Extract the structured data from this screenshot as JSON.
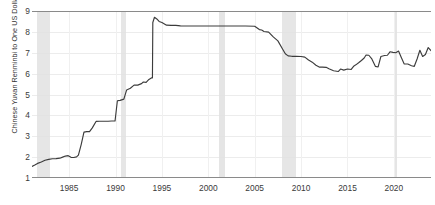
{
  "chart_data": {
    "type": "line",
    "title": "",
    "xlabel": "",
    "ylabel": "Chinese Yuvan Renminbi to One US Dollar",
    "xlim": [
      1981.0,
      2024.0
    ],
    "ylim": [
      1,
      9
    ],
    "yticks": [
      1,
      2,
      3,
      4,
      5,
      6,
      7,
      8,
      9
    ],
    "ytick_labels": [
      "1",
      "2",
      "3",
      "4",
      "5",
      "6",
      "7",
      "8",
      "9"
    ],
    "xticks": [
      1985,
      1990,
      1995,
      2000,
      2005,
      2010,
      2015,
      2020
    ],
    "xtick_labels": [
      "1985",
      "1990",
      "1995",
      "2000",
      "2005",
      "2010",
      "2015",
      "2020"
    ],
    "grid": "horizontal-and-vertical",
    "legend": "none",
    "line_color": "#3c3c3c",
    "recession_band_color": "#e2e2e2",
    "gridline_color": "#ececec",
    "axis_color": "#8a8a8a",
    "recession_bands": [
      {
        "start": 1981.5,
        "end": 1982.92,
        "label": "1981-1982 recession"
      },
      {
        "start": 1990.54,
        "end": 1991.17,
        "label": "1990-1991 recession"
      },
      {
        "start": 2001.17,
        "end": 2001.83,
        "label": "2001 recession"
      },
      {
        "start": 2007.96,
        "end": 2009.42,
        "label": "2008-2009 recession"
      },
      {
        "start": 2020.08,
        "end": 2020.33,
        "label": "2020 recession"
      }
    ],
    "series": [
      {
        "name": "Chinese Yuan Renminbi to One US Dollar",
        "x": [
          1981.0,
          1981.3,
          1981.6,
          1982.0,
          1982.4,
          1982.8,
          1983.2,
          1983.6,
          1984.0,
          1984.3,
          1984.6,
          1984.9,
          1985.2,
          1985.5,
          1985.8,
          1986.0,
          1986.3,
          1986.6,
          1986.9,
          1987.2,
          1987.5,
          1987.9,
          1988.3,
          1988.8,
          1989.2,
          1989.6,
          1989.95,
          1990.2,
          1990.5,
          1990.9,
          1991.2,
          1991.6,
          1992.0,
          1992.4,
          1992.8,
          1993.0,
          1993.3,
          1993.6,
          1993.9,
          1993.98,
          1994.02,
          1994.2,
          1994.45,
          1994.7,
          1995.0,
          1995.5,
          1996.0,
          1996.5,
          1997.0,
          1998.0,
          1999.0,
          2000.0,
          2001.0,
          2002.0,
          2003.0,
          2004.0,
          2005.0,
          2005.5,
          2005.75,
          2006.0,
          2006.5,
          2007.0,
          2007.5,
          2008.0,
          2008.3,
          2008.6,
          2009.0,
          2009.5,
          2010.0,
          2010.4,
          2010.8,
          2011.2,
          2011.6,
          2012.0,
          2012.3,
          2012.7,
          2013.0,
          2013.5,
          2014.0,
          2014.25,
          2014.6,
          2015.0,
          2015.4,
          2015.7,
          2015.9,
          2016.2,
          2016.5,
          2016.8,
          2017.0,
          2017.3,
          2017.6,
          2018.0,
          2018.3,
          2018.6,
          2019.0,
          2019.3,
          2019.6,
          2019.9,
          2020.2,
          2020.5,
          2020.8,
          2021.1,
          2021.5,
          2021.9,
          2022.2,
          2022.5,
          2022.8,
          2023.1,
          2023.4,
          2023.7,
          2024.0
        ],
        "y": [
          1.55,
          1.62,
          1.7,
          1.77,
          1.85,
          1.89,
          1.92,
          1.93,
          1.95,
          2.0,
          2.05,
          2.07,
          1.99,
          1.98,
          2.01,
          2.1,
          2.6,
          3.2,
          3.22,
          3.22,
          3.4,
          3.71,
          3.72,
          3.72,
          3.72,
          3.73,
          3.73,
          4.7,
          4.72,
          4.78,
          5.22,
          5.3,
          5.45,
          5.45,
          5.52,
          5.6,
          5.58,
          5.72,
          5.8,
          5.8,
          8.45,
          8.7,
          8.62,
          8.5,
          8.45,
          8.32,
          8.31,
          8.31,
          8.29,
          8.28,
          8.28,
          8.28,
          8.28,
          8.28,
          8.28,
          8.28,
          8.27,
          8.11,
          8.09,
          8.02,
          7.99,
          7.76,
          7.57,
          7.18,
          6.95,
          6.85,
          6.83,
          6.83,
          6.82,
          6.79,
          6.65,
          6.55,
          6.4,
          6.31,
          6.31,
          6.3,
          6.23,
          6.14,
          6.1,
          6.22,
          6.17,
          6.22,
          6.2,
          6.37,
          6.42,
          6.52,
          6.63,
          6.75,
          6.89,
          6.88,
          6.72,
          6.35,
          6.32,
          6.82,
          6.87,
          6.88,
          7.05,
          7.02,
          7.0,
          7.08,
          6.77,
          6.47,
          6.46,
          6.38,
          6.35,
          6.7,
          7.12,
          6.82,
          6.92,
          7.25,
          7.1
        ]
      }
    ]
  }
}
